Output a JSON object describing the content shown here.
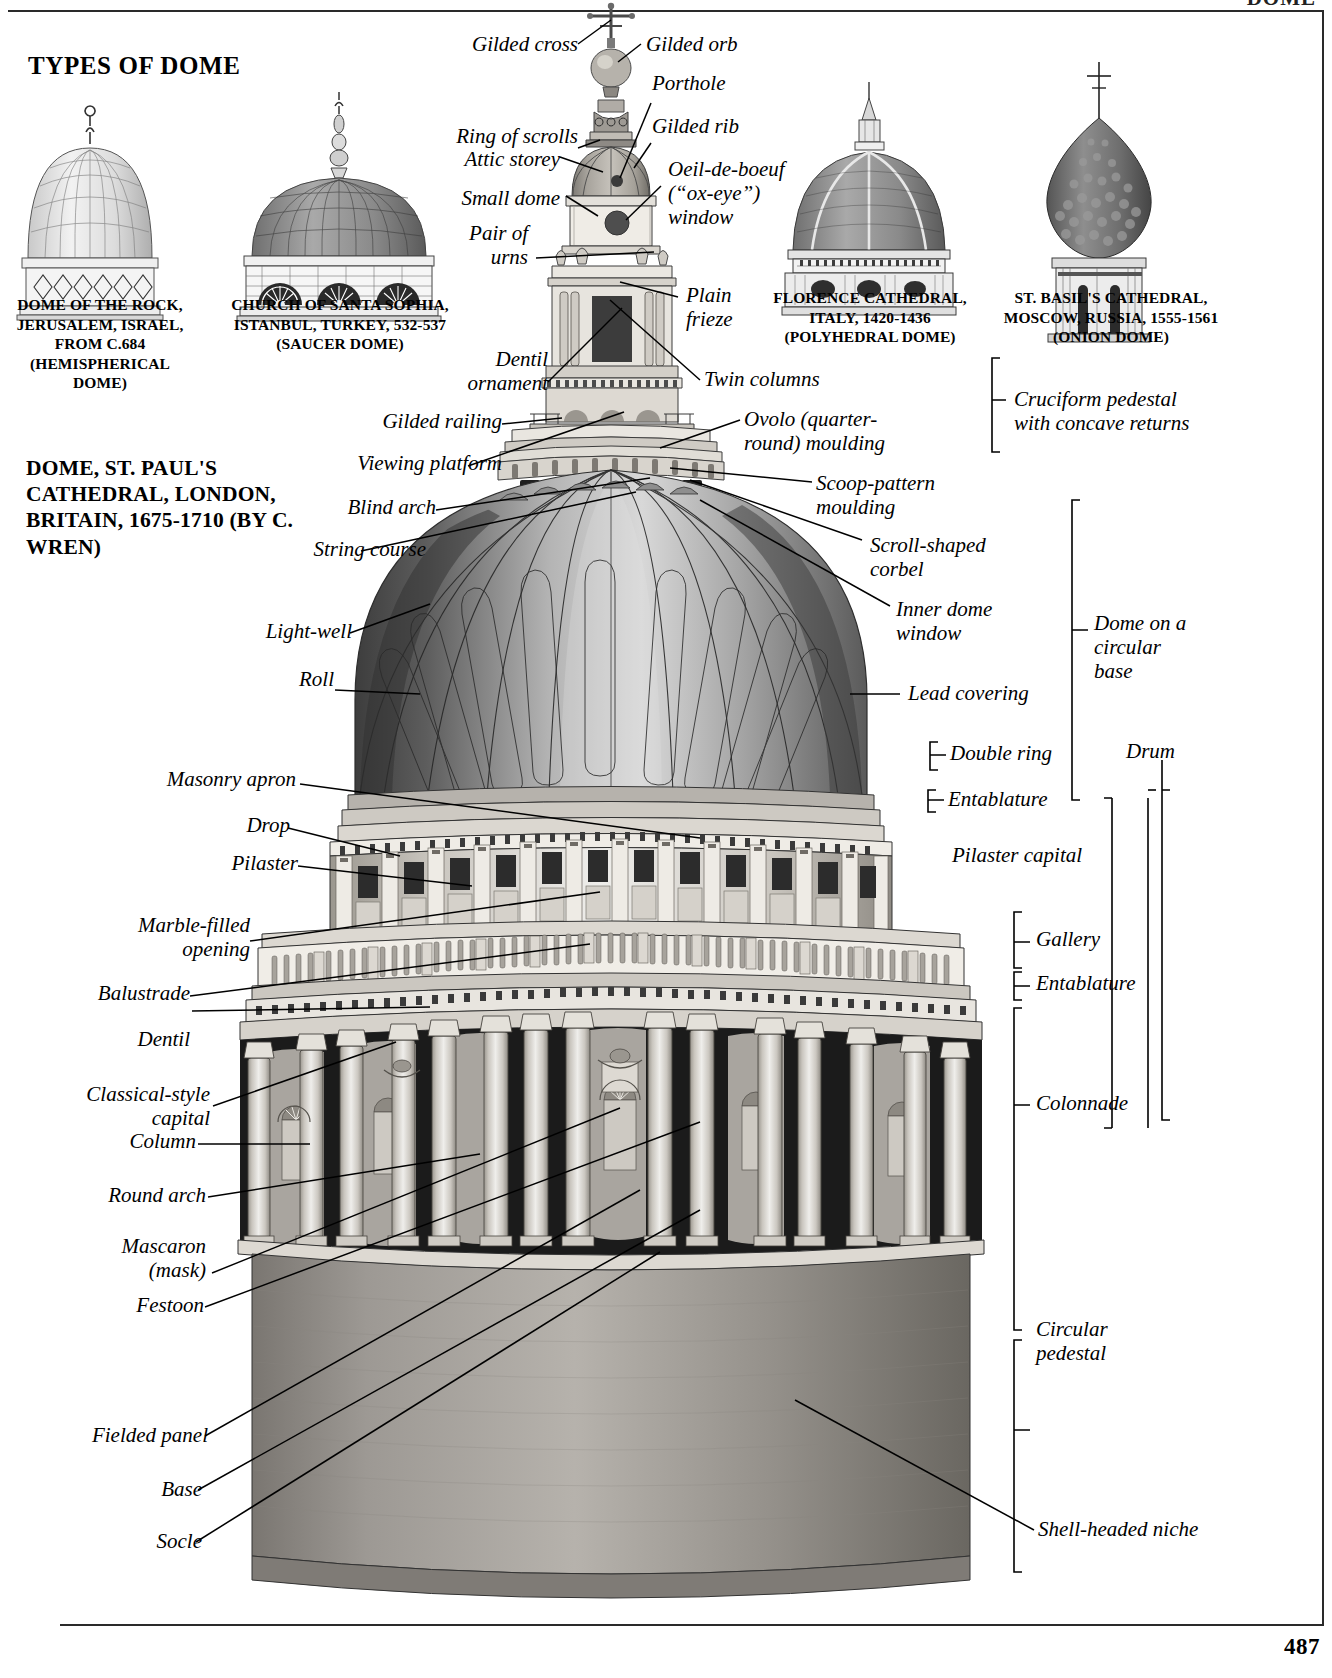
{
  "page": {
    "section_title": "TYPES OF DOME",
    "running_head": "DOME",
    "page_number": "487"
  },
  "main_subject": {
    "title": "DOME, ST. PAUL'S\nCATHEDRAL, LONDON,\nBRITAIN, 1675-1710\n(BY C. WREN)"
  },
  "thumbnails": [
    {
      "name": "dome-of-the-rock",
      "caption": "DOME OF THE\nROCK, JERUSALEM,\nISRAEL, FROM C.684\n(HEMISPHERICAL\nDOME)"
    },
    {
      "name": "santa-sophia",
      "caption": "CHURCH OF SANTA SOPHIA,\nISTANBUL, TURKEY, 532-537\n(SAUCER DOME)"
    },
    {
      "name": "florence-cathedral",
      "caption": "FLORENCE CATHEDRAL,\nITALY, 1420-1436\n(POLYHEDRAL DOME)"
    },
    {
      "name": "st-basils-cathedral",
      "caption": "ST. BASIL'S CATHEDRAL,\nMOSCOW, RUSSIA,\n1555-1561\n(ONION DOME)"
    }
  ],
  "labels_left": [
    {
      "id": "gilded-cross",
      "text": "Gilded cross"
    },
    {
      "id": "ring-of-scrolls",
      "text": "Ring of scrolls"
    },
    {
      "id": "small-dome",
      "text": "Small dome"
    },
    {
      "id": "attic-storey",
      "text": "Attic storey"
    },
    {
      "id": "pair-of-urns",
      "text": "Pair of\nurns"
    },
    {
      "id": "dentil-ornament",
      "text": "Dentil\nornament"
    },
    {
      "id": "gilded-railing",
      "text": "Gilded railing"
    },
    {
      "id": "viewing-platform",
      "text": "Viewing platform"
    },
    {
      "id": "blind-arch",
      "text": "Blind arch"
    },
    {
      "id": "string-course",
      "text": "String course"
    },
    {
      "id": "light-well",
      "text": "Light-well"
    },
    {
      "id": "roll",
      "text": "Roll"
    },
    {
      "id": "masonry-apron",
      "text": "Masonry apron"
    },
    {
      "id": "drop",
      "text": "Drop"
    },
    {
      "id": "pilaster",
      "text": "Pilaster"
    },
    {
      "id": "marble-filled-opening",
      "text": "Marble-filled\nopening"
    },
    {
      "id": "balustrade",
      "text": "Balustrade"
    },
    {
      "id": "dentil",
      "text": "Dentil"
    },
    {
      "id": "classical-style-capital",
      "text": "Classical-style\ncapital"
    },
    {
      "id": "column",
      "text": "Column"
    },
    {
      "id": "round-arch",
      "text": "Round arch"
    },
    {
      "id": "mascaron",
      "text": "Mascaron\n(mask)"
    },
    {
      "id": "festoon",
      "text": "Festoon"
    },
    {
      "id": "fielded-panel",
      "text": "Fielded panel"
    },
    {
      "id": "base",
      "text": "Base"
    },
    {
      "id": "socle",
      "text": "Socle"
    }
  ],
  "labels_right": [
    {
      "id": "gilded-orb",
      "text": "Gilded orb"
    },
    {
      "id": "porthole",
      "text": "Porthole"
    },
    {
      "id": "gilded-rib",
      "text": "Gilded rib"
    },
    {
      "id": "oeil-de-boeuf",
      "text": "Oeil-de-boeuf\n(“ox-eye”)\nwindow"
    },
    {
      "id": "plain-frieze",
      "text": "Plain\nfrieze"
    },
    {
      "id": "twin-columns",
      "text": "Twin columns"
    },
    {
      "id": "ovolo-moulding",
      "text": "Ovolo (quarter-\nround) moulding"
    },
    {
      "id": "scoop-pattern-moulding",
      "text": "Scoop-pattern\nmoulding"
    },
    {
      "id": "scroll-shaped-corbel",
      "text": "Scroll-shaped\ncorbel"
    },
    {
      "id": "inner-dome-window",
      "text": "Inner dome\nwindow"
    },
    {
      "id": "lead-covering",
      "text": "Lead covering"
    },
    {
      "id": "shell-headed-niche",
      "text": "Shell-headed niche"
    }
  ],
  "bracket_labels": [
    {
      "id": "cruciform-pedestal",
      "text": "Cruciform pedestal\nwith concave returns"
    },
    {
      "id": "dome-on-circular-base",
      "text": "Dome on a\ncircular\nbase"
    },
    {
      "id": "double-ring",
      "text": "Double ring"
    },
    {
      "id": "entablature-upper",
      "text": "Entablature"
    },
    {
      "id": "pilaster-capital",
      "text": "Pilaster capital"
    },
    {
      "id": "gallery",
      "text": "Gallery"
    },
    {
      "id": "entablature-lower",
      "text": "Entablature"
    },
    {
      "id": "colonnade",
      "text": "Colonnade"
    },
    {
      "id": "circular-pedestal",
      "text": "Circular\npedestal"
    },
    {
      "id": "drum",
      "text": "Drum"
    }
  ],
  "colors": {
    "ink": "#000000",
    "rule": "#2a2a2a",
    "stone_light": "#e8e6e2",
    "stone_mid": "#b9b5ae",
    "stone_dark": "#7c7871",
    "lead_dark": "#4a4a4a",
    "lead_mid": "#8d8d8d",
    "lead_light": "#cfcfcf"
  }
}
